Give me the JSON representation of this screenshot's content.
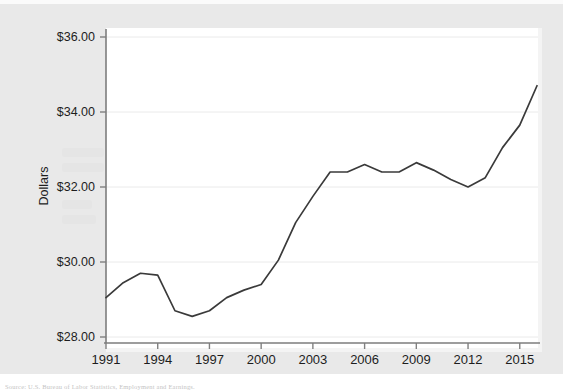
{
  "figure": {
    "background_color": "#e9e9e9",
    "plot_background_color": "#ffffff",
    "line_color": "#3a3a3a",
    "gridline_color": "#eaeaea",
    "axis_color": "#808080",
    "source_note": "Source: U.S. Bureau of Labor Statistics, Employment and Earnings."
  },
  "chart_data": {
    "type": "line",
    "title": "",
    "xlabel": "",
    "ylabel": "Dollars",
    "xlim": [
      1991,
      2016
    ],
    "ylim": [
      28,
      36
    ],
    "grid": true,
    "legend": "none",
    "y_tick_labels": [
      "$28.00",
      "$30.00",
      "$32.00",
      "$34.00",
      "$36.00"
    ],
    "y_tick_values": [
      28,
      30,
      32,
      34,
      36
    ],
    "x_tick_labels": [
      "1991",
      "1994",
      "1997",
      "2000",
      "2003",
      "2006",
      "2009",
      "2012",
      "2015"
    ],
    "x_tick_values": [
      1991,
      1994,
      1997,
      2000,
      2003,
      2006,
      2009,
      2012,
      2015
    ],
    "x": [
      1991,
      1992,
      1993,
      1994,
      1995,
      1996,
      1997,
      1998,
      1999,
      2000,
      2001,
      2002,
      2003,
      2004,
      2005,
      2006,
      2007,
      2008,
      2009,
      2010,
      2011,
      2012,
      2013,
      2014,
      2015,
      2016
    ],
    "series": [
      {
        "name": "Dollars",
        "values": [
          29.05,
          29.45,
          29.7,
          29.65,
          28.7,
          28.55,
          28.7,
          29.05,
          29.25,
          29.4,
          30.05,
          31.05,
          31.75,
          32.4,
          32.4,
          32.6,
          32.4,
          32.4,
          32.65,
          32.45,
          32.2,
          32.0,
          32.25,
          33.05,
          33.65,
          34.7
        ]
      }
    ]
  }
}
